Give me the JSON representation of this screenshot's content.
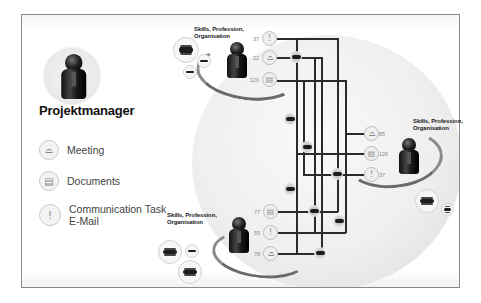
{
  "role": {
    "label": "Projektmanager",
    "icon": "person-icon"
  },
  "legend": [
    {
      "label": "Meeting",
      "icon": "meeting-icon",
      "glyph": "⌓"
    },
    {
      "label": "Documents",
      "icon": "documents-icon",
      "glyph": "▤"
    },
    {
      "label": "Communication Task",
      "label2": "E-Mail",
      "icon": "communication-icon",
      "glyph": "!"
    }
  ],
  "participants": [
    {
      "id": "top",
      "caption_line1": "Skills, Profession,",
      "caption_line2": "Organisation",
      "items": [
        {
          "type": "communication",
          "value": "37",
          "glyph": "!"
        },
        {
          "type": "meeting",
          "value": "22",
          "glyph": "⌓"
        },
        {
          "type": "documents",
          "value": "120",
          "glyph": "▤"
        }
      ]
    },
    {
      "id": "right",
      "caption_line1": "Skills, Profession,",
      "caption_line2": "Organisation",
      "items": [
        {
          "type": "meeting",
          "value": "85",
          "glyph": "⌓"
        },
        {
          "type": "documents",
          "value": "126",
          "glyph": "▤"
        },
        {
          "type": "communication",
          "value": "37",
          "glyph": "!"
        }
      ]
    },
    {
      "id": "bottom",
      "caption_line1": "Skills, Profession,",
      "caption_line2": "Organisation",
      "items": [
        {
          "type": "documents",
          "value": "77",
          "glyph": "▤"
        },
        {
          "type": "communication",
          "value": "55",
          "glyph": "!"
        },
        {
          "type": "meeting",
          "value": "78",
          "glyph": "⌓"
        }
      ]
    }
  ],
  "colors": {
    "line": "#2b2b2b",
    "frame": "#8a8a8a",
    "globe": "#ececec"
  }
}
